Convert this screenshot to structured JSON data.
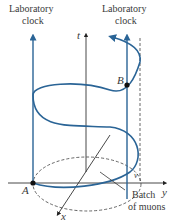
{
  "figure": {
    "labels": {
      "lab_clock_left_line1": "Laboratory",
      "lab_clock_left_line2": "clock",
      "lab_clock_right_line1": "Laboratory",
      "lab_clock_right_line2": "clock",
      "axis_t": "t",
      "axis_x": "x",
      "axis_y": "y",
      "point_A": "A",
      "point_B": "B",
      "v_label": "v",
      "batch_line1": "Batch",
      "batch_line2": "of muons"
    },
    "colors": {
      "helix": "#2a6496",
      "clock_line": "#2a6496",
      "axis": "#333333",
      "dashed": "#555555"
    }
  }
}
